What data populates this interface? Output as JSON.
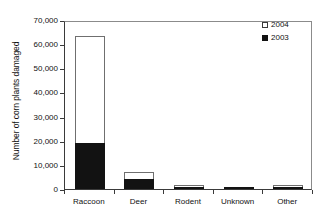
{
  "chart_data": {
    "type": "bar",
    "subtype": "stacked-vertical",
    "title": "",
    "xlabel": "",
    "ylabel": "Number of corn plants damaged",
    "categories": [
      "Raccoon",
      "Deer",
      "Rodent",
      "Unknown",
      "Other"
    ],
    "series": [
      {
        "name": "2003",
        "color": "#121212",
        "values": [
          19000,
          4200,
          700,
          700,
          200
        ]
      },
      {
        "name": "2004",
        "color": "#ffffff",
        "values": [
          44500,
          2800,
          500,
          0,
          100
        ]
      }
    ],
    "totals": [
      63500,
      7000,
      1200,
      700,
      300
    ],
    "ylim": [
      0,
      70000
    ],
    "ytick_values": [
      0,
      10000,
      20000,
      30000,
      40000,
      50000,
      60000,
      70000
    ],
    "ytick_labels": [
      "0",
      "10,000",
      "20,000",
      "30,000",
      "40,000",
      "50,000",
      "60,000",
      "70,000"
    ],
    "grid": false,
    "legend_position": "top-right",
    "legend_order": [
      "2004",
      "2003"
    ]
  },
  "axis": {
    "y_title": "Number of corn plants damaged"
  },
  "legend": {
    "entries": [
      {
        "label": "2004",
        "swatch": "open-square"
      },
      {
        "label": "2003",
        "swatch": "filled-square"
      }
    ]
  }
}
